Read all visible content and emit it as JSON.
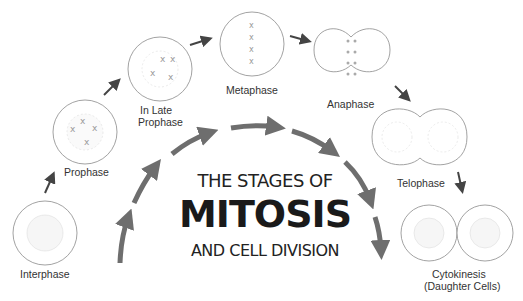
{
  "title": {
    "line1": "THE STAGES OF",
    "line2": "MITOSIS",
    "line3": "AND CELL DIVISION"
  },
  "stages": [
    {
      "name": "Interphase",
      "label": "Interphase"
    },
    {
      "name": "Prophase",
      "label": "Prophase"
    },
    {
      "name": "In Late Prophase",
      "label_line1": "In Late",
      "label_line2": "Prophase"
    },
    {
      "name": "Metaphase",
      "label": "Metaphase"
    },
    {
      "name": "Anaphase",
      "label": "Anaphase"
    },
    {
      "name": "Telophase",
      "label": "Telophase"
    },
    {
      "name": "Cytokinesis",
      "label_line1": "Cytokinesis",
      "label_line2": "(Daughter Cells)"
    }
  ],
  "colors": {
    "cell_outline": "#8a8a8a",
    "arrow": "#555555",
    "big_arrow": "#6e6e6e",
    "text": "#222222"
  }
}
